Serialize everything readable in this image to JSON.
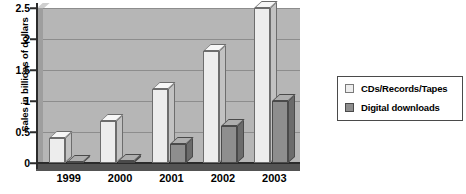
{
  "chart_data": {
    "type": "bar",
    "title": "",
    "xlabel": "",
    "ylabel": "Sales in billions of dollars",
    "categories": [
      "1999",
      "2000",
      "2001",
      "2002",
      "2003"
    ],
    "series": [
      {
        "name": "CDs/Records/Tapes",
        "values": [
          0.4,
          0.67,
          1.2,
          1.8,
          2.5
        ],
        "color": "#ededed"
      },
      {
        "name": "Digital downloads",
        "values": [
          0.02,
          0.03,
          0.3,
          0.6,
          1.0
        ],
        "color": "#8e8e8e"
      }
    ],
    "ylim": [
      0,
      2.5
    ],
    "yticks": [
      "0",
      "0.5",
      "1",
      "1.5",
      "2",
      "2.5"
    ],
    "ytick_values": [
      0,
      0.5,
      1,
      1.5,
      2,
      2.5
    ],
    "grid": true,
    "legend_position": "right",
    "style": "3d-grouped-bar",
    "plot_background": "#b6b6b6",
    "gridline_color": "#8d8d8d"
  },
  "legend": {
    "items": [
      {
        "label": "CDs/Records/Tapes",
        "swatch": "light-swatch-icon"
      },
      {
        "label": "Digital downloads",
        "swatch": "dark-swatch-icon"
      }
    ]
  }
}
